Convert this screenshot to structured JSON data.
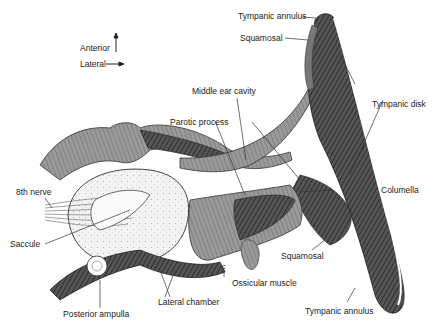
{
  "figure": {
    "orientation": {
      "anterior": "Anterior",
      "lateral": "Lateral"
    },
    "labels": {
      "tympanic_annulus_top": "Tympanic annulus",
      "squamosal_top": "Squamosal",
      "tympanic_disk": "Tympanic disk",
      "middle_ear_cavity": "Middle ear cavity",
      "parotic_process": "Parotic process",
      "columella": "Columella",
      "eighth_nerve": "8th nerve",
      "saccule": "Saccule",
      "squamosal_bottom": "Squamosal",
      "c_marker": "c",
      "ossicular_muscle": "Ossicular muscle",
      "lateral_chamber": "Lateral chamber",
      "posterior_ampulla": "Posterior ampulla",
      "tympanic_annulus_bottom": "Tympanic annulus"
    },
    "colors": {
      "dark_tissue": "#3a3a3a",
      "mid_tissue": "#8a8a8a",
      "light_tissue": "#d8d8d8",
      "stipple_fill": "#ececec",
      "line": "#333333"
    }
  }
}
